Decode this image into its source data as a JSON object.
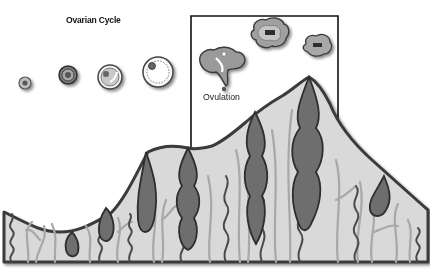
{
  "diagram": {
    "title": "Ovarian Cycle",
    "labels": {
      "ovulation": "Ovulation"
    },
    "colors": {
      "background": "#ffffff",
      "tissue_fill": "#d9d9d9",
      "outline": "#3a3a3a",
      "gland_fill": "#6e6e6e",
      "vessel_light": "#bdbdbd",
      "frame": "#111111"
    },
    "stages": [
      {
        "name": "primordial-follicle",
        "cx": 25,
        "cy": 83,
        "r": 6
      },
      {
        "name": "primary-follicle",
        "cx": 68,
        "cy": 75,
        "r": 9
      },
      {
        "name": "secondary-follicle",
        "cx": 110,
        "cy": 77,
        "r": 12
      },
      {
        "name": "mature-follicle",
        "cx": 158,
        "cy": 72,
        "r": 15
      },
      {
        "name": "ovulation",
        "cx": 224,
        "cy": 67
      },
      {
        "name": "corpus-luteum",
        "cx": 270,
        "cy": 33
      },
      {
        "name": "corpus-albicans",
        "cx": 318,
        "cy": 45
      }
    ],
    "highlight_box": {
      "x": 191,
      "y": 16,
      "right": 338
    }
  }
}
